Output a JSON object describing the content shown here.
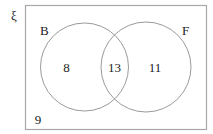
{
  "diagram": {
    "type": "venn",
    "universal_symbol": "ξ",
    "sets": [
      {
        "name": "B",
        "only_count": "8"
      },
      {
        "name": "F",
        "only_count": "11"
      }
    ],
    "intersection_count": "13",
    "outside_count": "9",
    "colors": {
      "stroke": "#9a9a9a",
      "text": "#222222",
      "background": "#ffffff"
    }
  }
}
